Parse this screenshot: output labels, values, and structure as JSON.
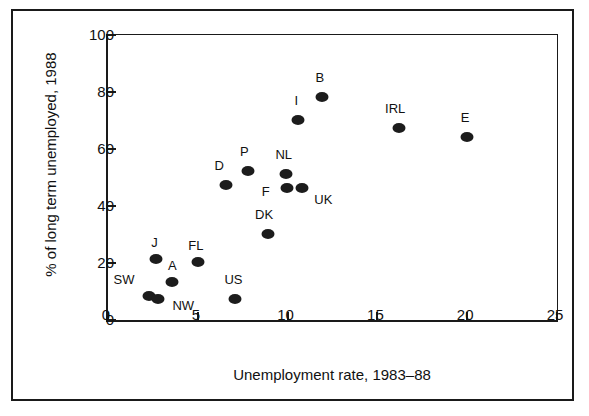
{
  "chart_data": {
    "type": "scatter",
    "title": "",
    "xlabel": "Unemployment rate, 1983–88",
    "ylabel": "% of long term unemployed, 1988",
    "xlim": [
      0,
      25
    ],
    "ylim": [
      0,
      100
    ],
    "xticks": [
      "0",
      "5",
      "10",
      "15",
      "20",
      "25"
    ],
    "xtick_values": [
      0,
      5,
      10,
      15,
      20,
      25
    ],
    "yticks": [
      "0",
      "20",
      "40",
      "60",
      "80",
      "100"
    ],
    "ytick_values": [
      0,
      20,
      40,
      60,
      80,
      100
    ],
    "grid": false,
    "legend": "none",
    "marker_color": "#1c1c1c",
    "points": [
      {
        "label": "SW",
        "x": 2.4,
        "y": 8,
        "lx": 1.0,
        "ly": 14
      },
      {
        "label": "NW",
        "x": 2.9,
        "y": 7,
        "lx": 4.3,
        "ly": 5
      },
      {
        "label": "J",
        "x": 2.8,
        "y": 21,
        "lx": 2.7,
        "ly": 27
      },
      {
        "label": "A",
        "x": 3.7,
        "y": 13,
        "lx": 3.7,
        "ly": 19
      },
      {
        "label": "FL",
        "x": 5.1,
        "y": 20,
        "lx": 5.0,
        "ly": 26
      },
      {
        "label": "US",
        "x": 7.2,
        "y": 7,
        "lx": 7.1,
        "ly": 14
      },
      {
        "label": "D",
        "x": 6.7,
        "y": 47,
        "lx": 6.3,
        "ly": 54
      },
      {
        "label": "P",
        "x": 7.9,
        "y": 52,
        "lx": 7.7,
        "ly": 59
      },
      {
        "label": "DK",
        "x": 9.0,
        "y": 30,
        "lx": 8.8,
        "ly": 37
      },
      {
        "label": "NL",
        "x": 10.0,
        "y": 51,
        "lx": 9.9,
        "ly": 58
      },
      {
        "label": "F",
        "x": 10.1,
        "y": 46,
        "lx": 8.9,
        "ly": 45
      },
      {
        "label": "UK",
        "x": 10.9,
        "y": 46,
        "lx": 12.1,
        "ly": 42
      },
      {
        "label": "I",
        "x": 10.7,
        "y": 70,
        "lx": 10.6,
        "ly": 77
      },
      {
        "label": "B",
        "x": 12.0,
        "y": 78,
        "lx": 11.9,
        "ly": 85
      },
      {
        "label": "IRL",
        "x": 16.3,
        "y": 67,
        "lx": 16.1,
        "ly": 74
      },
      {
        "label": "E",
        "x": 20.1,
        "y": 64,
        "lx": 20.0,
        "ly": 71
      }
    ]
  }
}
